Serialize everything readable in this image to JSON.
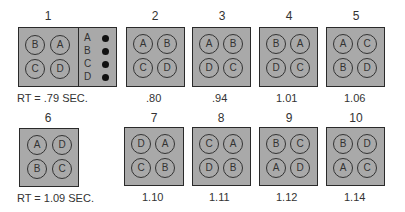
{
  "figure": {
    "fill_color": "#a9a9a9",
    "border_color": "#2a2a2a",
    "legend": {
      "items": [
        {
          "label": "A",
          "marker": "filled-dot"
        },
        {
          "label": "B",
          "marker": "filled-dot"
        },
        {
          "label": "C",
          "marker": "filled-dot"
        },
        {
          "label": "D",
          "marker": "filled-dot"
        }
      ]
    },
    "panels": [
      {
        "number": "1",
        "layout": [
          "B",
          "A",
          "C",
          "D"
        ],
        "caption": "RT = .79 SEC."
      },
      {
        "number": "2",
        "layout": [
          "A",
          "B",
          "C",
          "D"
        ],
        "caption": ".80"
      },
      {
        "number": "3",
        "layout": [
          "A",
          "B",
          "D",
          "C"
        ],
        "caption": ".94"
      },
      {
        "number": "4",
        "layout": [
          "B",
          "A",
          "D",
          "C"
        ],
        "caption": "1.01"
      },
      {
        "number": "5",
        "layout": [
          "A",
          "C",
          "B",
          "D"
        ],
        "caption": "1.06"
      },
      {
        "number": "6",
        "layout": [
          "A",
          "D",
          "B",
          "C"
        ],
        "caption": "RT = 1.09 SEC."
      },
      {
        "number": "7",
        "layout": [
          "D",
          "A",
          "C",
          "B"
        ],
        "caption": "1.10"
      },
      {
        "number": "8",
        "layout": [
          "C",
          "A",
          "D",
          "B"
        ],
        "caption": "1.11"
      },
      {
        "number": "9",
        "layout": [
          "B",
          "C",
          "A",
          "D"
        ],
        "caption": "1.12"
      },
      {
        "number": "10",
        "layout": [
          "B",
          "D",
          "A",
          "C"
        ],
        "caption": "1.14"
      }
    ]
  }
}
